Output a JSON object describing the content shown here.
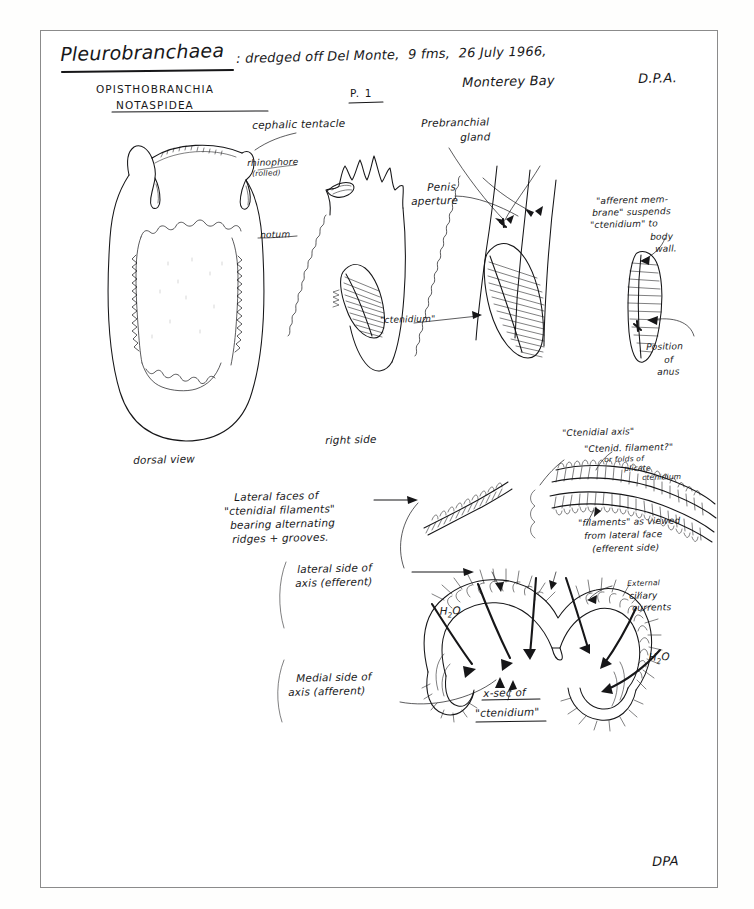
{
  "page": {
    "title_specimen": "Pleurobranchaea",
    "title_rest": ": dredged off Del Monte,  9 fms,  26 July 1966,",
    "title_line2_left": "Monterey Bay",
    "title_line2_right": "D.P.A.",
    "taxon_class": "OPISTHOBRANCHIA",
    "taxon_order": "NOTASPIDEA",
    "page_number": "P. 1",
    "footer_signature": "DPA"
  },
  "labels": {
    "cephalic_tentacle": "cephalic tentacle",
    "rhinophore": "rhinophore",
    "rhinophore_note": "(rolled)",
    "notum": "notum",
    "dorsal_view": "dorsal view",
    "right_side": "right side",
    "prebranchial_gland_l1": "Prebranchial",
    "prebranchial_gland_l2": "gland",
    "penis_aperture_l1": "Penis",
    "penis_aperture_l2": "aperture",
    "ctenidium_quoted": "\"ctenidium\"",
    "afferent_l1": "\"afferent mem-",
    "afferent_l2": "brane\" suspends",
    "afferent_l3": "\"ctenidium\" to",
    "afferent_l4": "body",
    "afferent_l5": "wall.",
    "position_anus_l1": "Position",
    "position_anus_l2": "of",
    "position_anus_l3": "anus",
    "ctenidial_axis": "\"Ctenidial axis\"",
    "ctenid_filament": "\"Ctenid. filament?\"",
    "folds_l1": "or folds of",
    "folds_l2": "plicate",
    "folds_l3": "ctenidium",
    "filaments_l1": "\"filaments\" as viewed",
    "filaments_l2": "from lateral face",
    "filaments_l3": "(efferent side)",
    "lateral_faces_l1": "Lateral faces of",
    "lateral_faces_l2": "\"ctenidial filaments\"",
    "lateral_faces_l3": "bearing alternating",
    "lateral_faces_l4": "ridges + grooves.",
    "lateral_side_l1": "lateral side of",
    "lateral_side_l2": "axis (efferent)",
    "medial_side_l1": "Medial side of",
    "medial_side_l2": "axis (afferent)",
    "external_ciliary_l1": "External",
    "external_ciliary_l2": "ciliary",
    "external_ciliary_l3": "currents",
    "water_left": "H",
    "water_sub": "2",
    "water_tail": "O",
    "xsec_l1": "x-sec of",
    "xsec_l2": "\"ctenidium\""
  },
  "colors": {
    "ink": "#161618",
    "paper": "#ffffff",
    "border": "#8b8b8b"
  }
}
